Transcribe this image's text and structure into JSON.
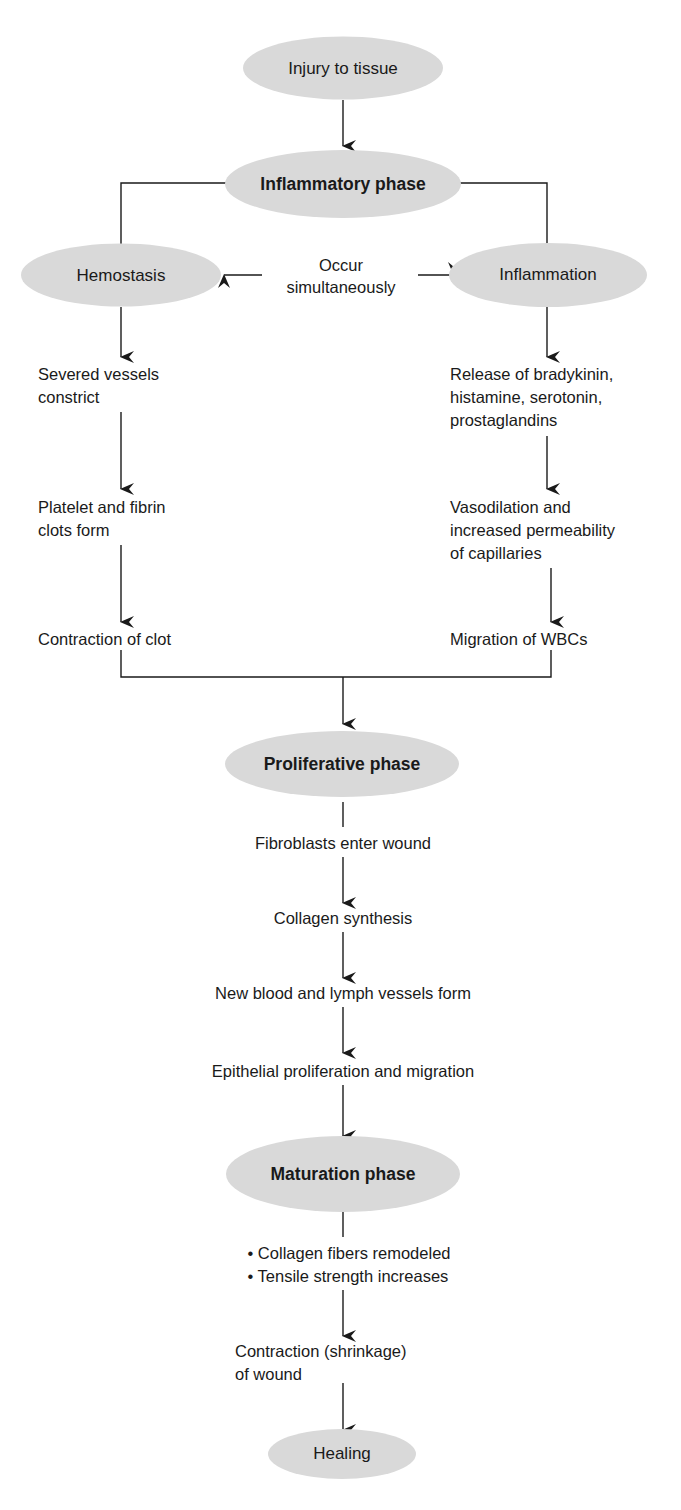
{
  "diagram": {
    "colors": {
      "node_fill": "#d9d9d9",
      "line": "#1a1a1a",
      "text": "#1a1a1a",
      "background": "#ffffff"
    },
    "nodes": {
      "injury": "Injury to tissue",
      "inflammatory_phase": "Inflammatory phase",
      "hemostasis": "Hemostasis",
      "inflammation": "Inflammation",
      "proliferative_phase": "Proliferative phase",
      "maturation_phase": "Maturation phase",
      "healing": "Healing"
    },
    "occur_simultaneously": [
      "Occur",
      "simultaneously"
    ],
    "hemostasis_steps": [
      [
        "Severed vessels",
        "constrict"
      ],
      [
        "Platelet and fibrin",
        "clots form"
      ],
      [
        "Contraction of clot"
      ]
    ],
    "inflammation_steps": [
      [
        "Release of bradykinin,",
        "histamine, serotonin,",
        "prostaglandins"
      ],
      [
        "Vasodilation and",
        "increased permeability",
        "of capillaries"
      ],
      [
        "Migration of WBCs"
      ]
    ],
    "proliferative_steps": [
      "Fibroblasts enter wound",
      "Collagen synthesis",
      "New blood and lymph vessels form",
      "Epithelial proliferation and migration"
    ],
    "maturation_bullets": [
      "• Collagen fibers remodeled",
      "• Tensile strength increases"
    ],
    "contraction": [
      "Contraction (shrinkage)",
      "of wound"
    ]
  }
}
